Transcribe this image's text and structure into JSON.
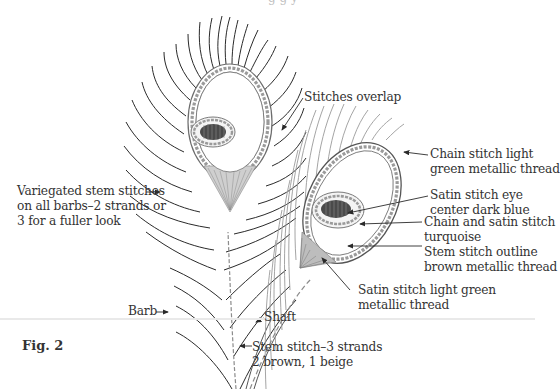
{
  "figure": {
    "label": "Fig. 2",
    "colors": {
      "line": "#2a2a2a",
      "stitch_gray": "#8c8c8c",
      "eye_dark": "#4a4a4a",
      "page_break": "#e9e9e9"
    }
  },
  "top_cut_text": "g g y",
  "callouts": {
    "stitches_overlap": "Stitches overlap",
    "chain_stitch": [
      "Chain stitch light",
      "green metallic thread"
    ],
    "satin_eye": [
      "Satin stitch eye",
      "center dark blue"
    ],
    "chain_satin": [
      "Chain and satin stitch",
      "turquoise"
    ],
    "stem_outline": [
      "Stem stitch outline",
      "brown metallic thread"
    ],
    "satin_light_green": [
      "Satin stitch light green",
      "metallic thread"
    ],
    "variegated": [
      "Variegated stem stitches",
      "on all barbs–2 strands or",
      "3 for a fuller look"
    ],
    "barb": "Barb",
    "shaft": "Shaft",
    "stem_shaft": [
      "Stem stitch–3 strands",
      "2 brown, 1 beige"
    ]
  }
}
